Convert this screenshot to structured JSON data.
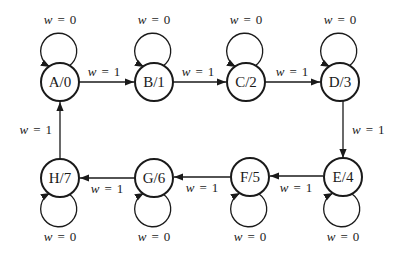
{
  "diagram": {
    "type": "moore-state-machine",
    "nodes": [
      {
        "id": "A",
        "label": "A/0",
        "state": "A",
        "output": "0"
      },
      {
        "id": "B",
        "label": "B/1",
        "state": "B",
        "output": "1"
      },
      {
        "id": "C",
        "label": "C/2",
        "state": "C",
        "output": "2"
      },
      {
        "id": "D",
        "label": "D/3",
        "state": "D",
        "output": "3"
      },
      {
        "id": "E",
        "label": "E/4",
        "state": "E",
        "output": "4"
      },
      {
        "id": "F",
        "label": "F/5",
        "state": "F",
        "output": "5"
      },
      {
        "id": "G",
        "label": "G/6",
        "state": "G",
        "output": "6"
      },
      {
        "id": "H",
        "label": "H/7",
        "state": "H",
        "output": "7"
      }
    ],
    "edges": [
      {
        "from": "A",
        "to": "B",
        "label": "w = 1",
        "var": "w",
        "eq": "=",
        "val": "1"
      },
      {
        "from": "B",
        "to": "C",
        "label": "w = 1",
        "var": "w",
        "eq": "=",
        "val": "1"
      },
      {
        "from": "C",
        "to": "D",
        "label": "w = 1",
        "var": "w",
        "eq": "=",
        "val": "1"
      },
      {
        "from": "D",
        "to": "E",
        "label": "w = 1",
        "var": "w",
        "eq": "=",
        "val": "1"
      },
      {
        "from": "E",
        "to": "F",
        "label": "w = 1",
        "var": "w",
        "eq": "=",
        "val": "1"
      },
      {
        "from": "F",
        "to": "G",
        "label": "w = 1",
        "var": "w",
        "eq": "=",
        "val": "1"
      },
      {
        "from": "G",
        "to": "H",
        "label": "w = 1",
        "var": "w",
        "eq": "=",
        "val": "1"
      },
      {
        "from": "H",
        "to": "A",
        "label": "w = 1",
        "var": "w",
        "eq": "=",
        "val": "1"
      }
    ],
    "self_loops": [
      {
        "node": "A",
        "label": "w = 0",
        "var": "w",
        "eq": "=",
        "val": "0"
      },
      {
        "node": "B",
        "label": "w = 0",
        "var": "w",
        "eq": "=",
        "val": "0"
      },
      {
        "node": "C",
        "label": "w = 0",
        "var": "w",
        "eq": "=",
        "val": "0"
      },
      {
        "node": "D",
        "label": "w = 0",
        "var": "w",
        "eq": "=",
        "val": "0"
      },
      {
        "node": "E",
        "label": "w = 0",
        "var": "w",
        "eq": "=",
        "val": "0"
      },
      {
        "node": "F",
        "label": "w = 0",
        "var": "w",
        "eq": "=",
        "val": "0"
      },
      {
        "node": "G",
        "label": "w = 0",
        "var": "w",
        "eq": "=",
        "val": "0"
      },
      {
        "node": "H",
        "label": "w = 0",
        "var": "w",
        "eq": "=",
        "val": "0"
      }
    ]
  }
}
